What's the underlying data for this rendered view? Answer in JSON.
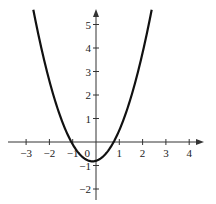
{
  "chart_data": {
    "type": "line",
    "title": "",
    "xlabel": "",
    "ylabel": "",
    "xlim": [
      -3.6,
      4.6
    ],
    "ylim": [
      -2.5,
      5.7
    ],
    "grid": false,
    "legend": null,
    "x_ticks": [
      -3,
      -2,
      -1,
      1,
      2,
      3,
      4
    ],
    "x_tick_labels": [
      "−3",
      "−2",
      "−1",
      "1",
      "2",
      "3",
      "4"
    ],
    "y_ticks": [
      -2,
      -1,
      1,
      2,
      3,
      4,
      5
    ],
    "y_tick_labels": [
      "−2",
      "−1",
      "1",
      "2",
      "3",
      "4",
      "5"
    ],
    "origin_label": "0",
    "series": [
      {
        "name": "parabola",
        "x": [
          -2.69,
          -2.5,
          -2.0,
          -1.5,
          -1.06,
          -1.0,
          -0.5,
          -0.15,
          0.0,
          0.5,
          0.76,
          1.0,
          1.5,
          2.0,
          2.39
        ],
        "y": [
          5.63,
          4.7,
          2.6,
          1.0,
          0.0,
          -0.1,
          -0.7,
          -0.82,
          -0.8,
          -0.4,
          0.0,
          0.5,
          1.9,
          3.8,
          5.63
        ]
      }
    ],
    "color": "#111111"
  }
}
